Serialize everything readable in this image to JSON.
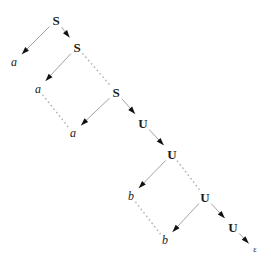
{
  "diagram": {
    "type": "derivation-tree",
    "title": "",
    "nodes": [
      {
        "id": "s1",
        "label": "S",
        "kind": "nonterminal",
        "x": 56,
        "y": 20
      },
      {
        "id": "a1",
        "label": "a",
        "kind": "terminal",
        "x": 14,
        "y": 62
      },
      {
        "id": "s2",
        "label": "S",
        "kind": "nonterminal",
        "x": 77,
        "y": 47
      },
      {
        "id": "a2",
        "label": "a",
        "kind": "terminal",
        "x": 38,
        "y": 89
      },
      {
        "id": "s3",
        "label": "S",
        "kind": "nonterminal",
        "x": 116,
        "y": 92
      },
      {
        "id": "a3",
        "label": "a",
        "kind": "terminal",
        "x": 73,
        "y": 133
      },
      {
        "id": "u1",
        "label": "U",
        "kind": "nonterminal",
        "x": 143,
        "y": 123
      },
      {
        "id": "u2",
        "label": "U",
        "kind": "nonterminal",
        "x": 172,
        "y": 154
      },
      {
        "id": "b1",
        "label": "b",
        "kind": "terminal",
        "x": 131,
        "y": 196
      },
      {
        "id": "u3",
        "label": "U",
        "kind": "nonterminal",
        "x": 205,
        "y": 197
      },
      {
        "id": "b2",
        "label": "b",
        "kind": "terminal",
        "x": 165,
        "y": 240
      },
      {
        "id": "u4",
        "label": "U",
        "kind": "nonterminal",
        "x": 233,
        "y": 227
      },
      {
        "id": "eps",
        "label": "ε",
        "kind": "epsilon",
        "x": 255,
        "y": 250
      }
    ],
    "edges": [
      {
        "from": "s1",
        "to": "a1",
        "style": "solid",
        "arrow": true
      },
      {
        "from": "s1",
        "to": "s2",
        "style": "solid",
        "arrow": true
      },
      {
        "from": "s2",
        "to": "a2",
        "style": "solid",
        "arrow": true
      },
      {
        "from": "s2",
        "to": "s3",
        "style": "dotted",
        "arrow": false
      },
      {
        "from": "a2",
        "to": "a3",
        "style": "dotted",
        "arrow": false
      },
      {
        "from": "s3",
        "to": "a3",
        "style": "solid",
        "arrow": true
      },
      {
        "from": "s3",
        "to": "u1",
        "style": "solid",
        "arrow": true
      },
      {
        "from": "u1",
        "to": "u2",
        "style": "solid",
        "arrow": true
      },
      {
        "from": "u2",
        "to": "b1",
        "style": "solid",
        "arrow": true
      },
      {
        "from": "u2",
        "to": "u3",
        "style": "dotted",
        "arrow": false
      },
      {
        "from": "b1",
        "to": "b2",
        "style": "dotted",
        "arrow": false
      },
      {
        "from": "u3",
        "to": "b2",
        "style": "solid",
        "arrow": true
      },
      {
        "from": "u3",
        "to": "u4",
        "style": "solid",
        "arrow": true
      },
      {
        "from": "u4",
        "to": "eps",
        "style": "solid",
        "arrow": true
      }
    ],
    "colors": {
      "ink": "#1a1a1a",
      "edge_solid": "#8a8a8a",
      "edge_dotted": "#b0b0b0",
      "arrowhead": "#111111",
      "background": "#ffffff"
    }
  }
}
